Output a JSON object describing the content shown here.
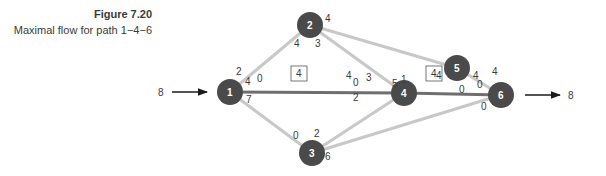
{
  "caption": {
    "figure_number": "Figure 7.20",
    "title": "Maximal flow for path 1−4−6"
  },
  "colors": {
    "node_fill": "#4a4a4a",
    "edge_default": "#c8c8c8",
    "edge_highlight": "#6e6e6e",
    "text": "#3a3a3a"
  },
  "source": {
    "value": "8"
  },
  "sink": {
    "value": "8"
  },
  "nodes": [
    {
      "id": "1",
      "label": "1"
    },
    {
      "id": "2",
      "label": "2"
    },
    {
      "id": "3",
      "label": "3"
    },
    {
      "id": "4",
      "label": "4"
    },
    {
      "id": "5",
      "label": "5"
    },
    {
      "id": "6",
      "label": "6"
    }
  ],
  "edges": [
    {
      "from": "1",
      "to": "2",
      "cap_from": "2",
      "cap_to": "4"
    },
    {
      "from": "1",
      "to": "4",
      "cap_from": "4",
      "cap_to": "0",
      "highlighted": true,
      "flow_box": "4",
      "extra_from": "0",
      "extra_to": "4"
    },
    {
      "from": "1",
      "to": "3",
      "cap_from": "7",
      "cap_to": "0"
    },
    {
      "from": "2",
      "to": "4",
      "cap_from": "3",
      "cap_to": "3"
    },
    {
      "from": "2",
      "to": "5",
      "cap_from": "4",
      "cap_to": "4"
    },
    {
      "from": "3",
      "to": "4",
      "cap_from": "2",
      "cap_to": "2"
    },
    {
      "from": "3",
      "to": "6",
      "cap_from": "6",
      "cap_to": "0"
    },
    {
      "from": "4",
      "to": "6",
      "cap_from": "5",
      "cap_to": "0",
      "highlighted": true,
      "flow_box": "4",
      "extra_from": "1",
      "extra_to": "4"
    },
    {
      "from": "5",
      "to": "6",
      "cap_from": "0",
      "cap_to": "4"
    }
  ],
  "labels": {
    "n1_to2": "2",
    "n1_to4_a": "4",
    "n1_to4_b": "0",
    "n1_to3": "7",
    "n2_to1": "4",
    "n2_to4": "3",
    "n2_to5": "4",
    "n4_from2": "3",
    "n4_to1_a": "4",
    "n4_to1_b": "0",
    "n4_to3": "2",
    "n4_to6_a": "5",
    "n4_to6_b": "1",
    "n3_to1": "0",
    "n3_to4": "2",
    "n3_to6": "6",
    "n5_to2": "4",
    "n5_to6": "0",
    "n6_to5": "4",
    "n6_to4_a": "4",
    "n6_to4_b": "0",
    "n6_to3": "0",
    "box_14": "4",
    "box_46": "4"
  }
}
